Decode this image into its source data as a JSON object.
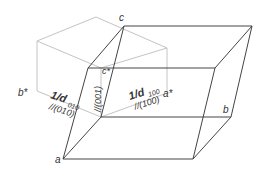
{
  "diagram": {
    "type": "crystal-lattice-reciprocal",
    "colors": {
      "direct": "#444444",
      "reciprocal": "#c4c4c4",
      "text": "#333333"
    },
    "labels": {
      "a": "a",
      "b": "b",
      "c": "c",
      "a_star": "a*",
      "b_star": "b*",
      "c_star": "c*",
      "d100": "1/d",
      "d100_sub": "100",
      "d100_plane": "//(100)",
      "d010": "1/d",
      "d010_sub": "010",
      "d010_plane": "//(010)",
      "d001_plane": "//(001)"
    }
  }
}
